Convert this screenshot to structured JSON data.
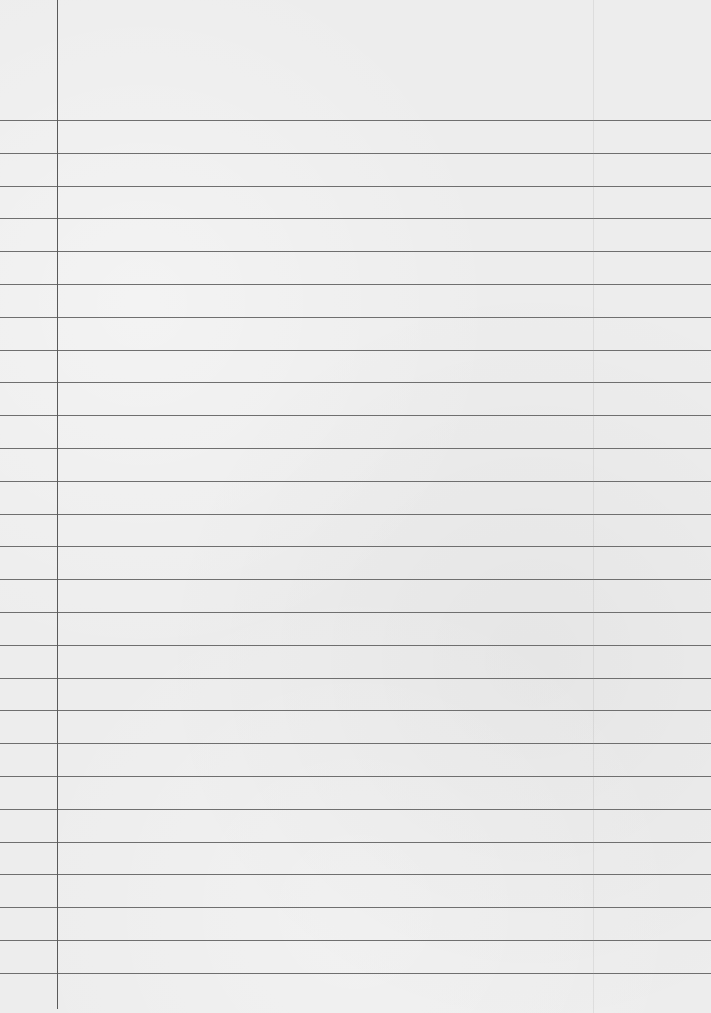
{
  "paper": {
    "type": "lined-notebook-paper",
    "background_color": "#ededed",
    "rule_color": "#6f6f6f",
    "margin_color": "#5a5a5a",
    "first_rule_y": 120,
    "rule_spacing": 32.8,
    "rule_count": 27,
    "margin_x": 57,
    "fold_x": 593,
    "text": ""
  }
}
